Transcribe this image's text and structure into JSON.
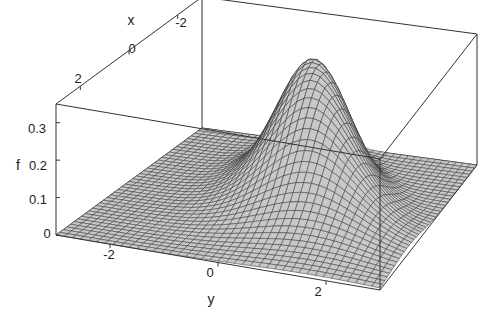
{
  "chart_data": {
    "type": "surface3d",
    "title": "",
    "xlabel": "x",
    "ylabel": "y",
    "zlabel": "f",
    "x_ticks": [
      "2",
      "0",
      "-2"
    ],
    "y_ticks": [
      "-2",
      "0",
      "2"
    ],
    "z_ticks": [
      "0",
      "0.1",
      "0.2",
      "0.3"
    ],
    "xlim": [
      -3,
      3
    ],
    "ylim": [
      -3,
      3
    ],
    "zlim": [
      0,
      0.35
    ],
    "peak": {
      "x": -1.0,
      "y": 0.3,
      "f": 0.34
    },
    "mesh_resolution": 40,
    "surface_color": "#c8c8c8",
    "mesh_line_color": "#333333",
    "box_visible": true
  },
  "labels": {
    "x_axis": "x",
    "y_axis": "y",
    "z_axis": "f",
    "x_tick_2": "2",
    "x_tick_0": "0",
    "x_tick_m2": "-2",
    "y_tick_m2": "-2",
    "y_tick_0": "0",
    "y_tick_2": "2",
    "z_tick_0": "0",
    "z_tick_01": "0.1",
    "z_tick_02": "0.2",
    "z_tick_03": "0.3"
  }
}
